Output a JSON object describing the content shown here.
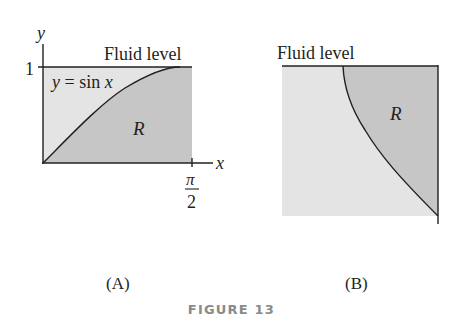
{
  "figure": {
    "caption": "FIGURE 13",
    "colors": {
      "light_region": "#e4e4e4",
      "dark_region": "#c6c6c6",
      "line": "#231f20",
      "caption_text": "#8a8a8a"
    },
    "panel_a": {
      "label": "(A)",
      "y_axis_label": "y",
      "x_axis_label": "x",
      "y_tick_label": "1",
      "x_tick_label_numerator": "π",
      "x_tick_label_denominator": "2",
      "fluid_level_label": "Fluid level",
      "curve_label_lhs": "y",
      "curve_label_eq": " = sin ",
      "curve_label_var": "x",
      "region_label": "R"
    },
    "panel_b": {
      "label": "(B)",
      "fluid_level_label": "Fluid level",
      "region_label": "R"
    }
  }
}
